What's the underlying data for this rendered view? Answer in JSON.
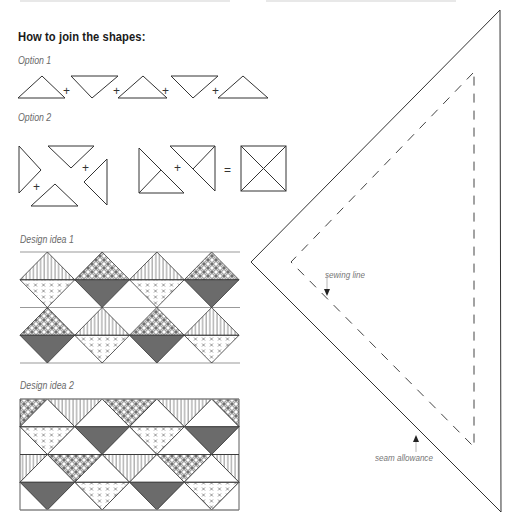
{
  "document": {
    "heading": "How to join the shapes:",
    "options": [
      {
        "label": "Option 1",
        "operator": "+"
      },
      {
        "label": "Option 2",
        "operators": [
          "+",
          "+",
          "+",
          "="
        ]
      }
    ],
    "designs": [
      {
        "label": "Design idea 1",
        "rows": [
          [
            "stripes-crosses",
            "circles-solid",
            "stripes-crosses",
            "circles-solid"
          ],
          [
            "circles-solid",
            "stripes-crosses",
            "circles-solid",
            "stripes-crosses"
          ]
        ]
      },
      {
        "label": "Design idea 2"
      }
    ],
    "template": {
      "sewing_line_label": "sewing line",
      "seam_allowance_label": "seam allowance"
    }
  },
  "colors": {
    "line": "#333333",
    "fill_dark": "#6b6b6b",
    "rule": "#999999"
  }
}
